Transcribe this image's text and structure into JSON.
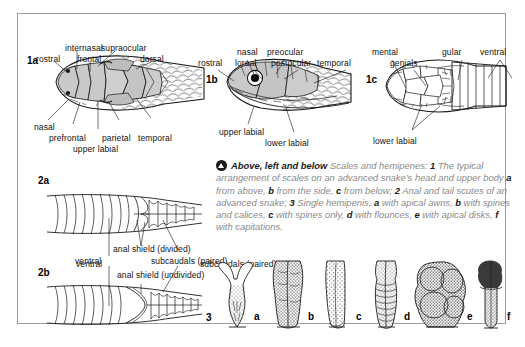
{
  "plate": {
    "background_color": "#ffffff",
    "frame_color": "#9c9c9c",
    "ink_color": "#111111",
    "scale_fill": "#c9c9c9",
    "caption_text_color": "#8a8a8a"
  },
  "panels": {
    "p1a": {
      "id": "1a",
      "labels": {
        "internasal": "internasal",
        "supraocular": "supraocular",
        "rostral": "rostral",
        "frontal": "frontal",
        "dorsal": "dorsal",
        "nasal": "nasal",
        "prefrontal": "prefrontal",
        "upper_labial": "upper labial",
        "parietal": "parietal",
        "temporal": "temporal"
      }
    },
    "p1b": {
      "id": "1b",
      "labels": {
        "nasal": "nasal",
        "preocular": "preocular",
        "rostral": "rostral",
        "loreal": "loreal",
        "postocular": "postocular",
        "temporal": "temporal",
        "upper_labial": "upper labial",
        "lower_labial": "lower labial"
      }
    },
    "p1c": {
      "id": "1c",
      "labels": {
        "mental": "mental",
        "genials": "genials",
        "gular": "gular",
        "ventral": "ventral",
        "lower_labial": "lower labial"
      }
    },
    "p2a": {
      "id": "2a",
      "labels": {
        "anal_shield": "anal shield (divided)",
        "ventral": "ventral",
        "subcaudals": "subcaudals (paired)"
      }
    },
    "p2b": {
      "id": "2b",
      "labels": {
        "anal_shield": "anal shield (undivided)"
      }
    },
    "p3": {
      "id": "3",
      "figures": [
        {
          "letter": "a"
        },
        {
          "letter": "b"
        },
        {
          "letter": "c"
        },
        {
          "letter": "d"
        },
        {
          "letter": "e"
        },
        {
          "letter": "f"
        }
      ]
    }
  },
  "caption": {
    "icon": "up-triangle-in-circle-icon",
    "heading": "Above, left and below",
    "lead": "Scales and hemipenes:",
    "item1_num": "1",
    "item1_text": "The typical arrangement of scales on an advanced snake’s head and upper body",
    "item1a_num": "a",
    "item1a_text": "from above,",
    "item1b_num": "b",
    "item1b_text": "from the side,",
    "item1c_num": "c",
    "item1c_text": "from below;",
    "item2_num": "2",
    "item2_text": "Anal and tail scutes of an advanced snake;",
    "item3_num": "3",
    "item3_text": "Single hemipenis,",
    "item3a_num": "a",
    "item3a_text": "with apical awns,",
    "item3b_num": "b",
    "item3b_text": "with spines and calices,",
    "item3c_num": "c",
    "item3c_text": "with spines only,",
    "item3d_num": "d",
    "item3d_text": "with flounces,",
    "item3e_num": "e",
    "item3e_text": "with apical disks,",
    "item3f_num": "f",
    "item3f_text": "with capitations."
  }
}
